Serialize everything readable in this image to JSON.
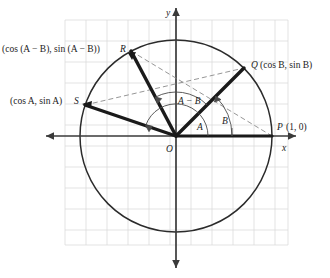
{
  "figure": {
    "axes": {
      "x_label": "x",
      "y_label": "y",
      "origin_label": "O"
    },
    "colors": {
      "grid": "#dcdcdc",
      "circle": "#2b2b2b",
      "axis": "#3a3a3a",
      "radius_bold": "#1a1a1a",
      "chord_dashed": "#8a8a8a",
      "arc": "#4a4a4a",
      "text": "#1b1b1b",
      "background": "#ffffff"
    },
    "geometry": {
      "center_x": 176,
      "center_y": 136,
      "radius": 96,
      "grid_spacing": 21
    },
    "points": [
      {
        "key": "P",
        "name": "point-p",
        "label": "P",
        "coords_text": "(1, 0)",
        "angle_deg": 0,
        "x": 272,
        "y": 136
      },
      {
        "key": "Q",
        "name": "point-q",
        "label": "Q",
        "coords_text": "(cos B, sin B)",
        "angle_deg": 45,
        "x": 244,
        "y": 68
      },
      {
        "key": "R",
        "name": "point-r",
        "label": "R",
        "coords_text": "(cos (A − B), sin (A − B))",
        "angle_deg": 118,
        "x": 131,
        "y": 51
      },
      {
        "key": "S",
        "name": "point-s",
        "label": "S",
        "coords_text": "(cos A, sin A)",
        "angle_deg": 161,
        "x": 85,
        "y": 105
      }
    ],
    "angles": [
      {
        "key": "A",
        "name": "angle-a",
        "label": "A",
        "from_deg": 0,
        "to_deg": 161,
        "arc_radius": 32,
        "label_x": 203,
        "label_y": 124
      },
      {
        "key": "B",
        "name": "angle-b",
        "label": "B",
        "from_deg": 0,
        "to_deg": 45,
        "arc_radius": 56,
        "label_x": 226,
        "label_y": 115
      },
      {
        "key": "A-B",
        "name": "angle-a-minus-b",
        "label": "A − B",
        "from_deg": 45,
        "to_deg": 118,
        "arc_radius": 44,
        "label_x": 197,
        "label_y": 100
      }
    ],
    "radii": [
      {
        "name": "radius-op",
        "from": "O",
        "to": "P",
        "style": "bold"
      },
      {
        "name": "radius-oq",
        "from": "O",
        "to": "Q",
        "style": "bold"
      },
      {
        "name": "radius-or",
        "from": "O",
        "to": "R",
        "style": "bold"
      },
      {
        "name": "radius-os",
        "from": "O",
        "to": "S",
        "style": "bold"
      }
    ],
    "chords": [
      {
        "name": "chord-sq",
        "from": "S",
        "to": "Q",
        "style": "dashed"
      },
      {
        "name": "chord-rp",
        "from": "R",
        "to": "P",
        "style": "dashed"
      }
    ]
  }
}
